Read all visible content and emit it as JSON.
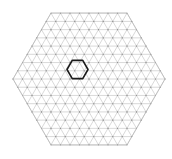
{
  "figure": {
    "title": "",
    "background_color": "#ffffff",
    "width": 172,
    "height": 159
  },
  "chart_data": {
    "type": "diagram",
    "subtype": "triangular-lattice-mesh",
    "title": "",
    "subtitle": "",
    "xlabel": "",
    "ylabel": "",
    "grid": true,
    "legend": null,
    "annotations": [],
    "domain": {
      "shape": "hexagon",
      "orientation": "flat-top",
      "center": [
        89,
        79
      ],
      "circumradius": 76,
      "vertices": [
        [
          13,
          79
        ],
        [
          51,
          13
        ],
        [
          127,
          13
        ],
        [
          165,
          79
        ],
        [
          127,
          145
        ],
        [
          51,
          145
        ]
      ],
      "edge_subdivisions": 8,
      "outline_color": "#b4b4b4",
      "outline_width": 0.7
    },
    "mesh": {
      "element_type": "triangle",
      "cells_per_side": 8,
      "edge_length_px": 9.5,
      "line_color": "#b9b9b9",
      "line_width": 0.55,
      "node_color": "#8c8c8c",
      "node_radius_px": 0.55,
      "node_count": 217,
      "triangle_count": 384
    },
    "highlight": {
      "label": "",
      "shape": "hexagon",
      "orientation": "flat-top",
      "center": [
        77.5,
        69.5
      ],
      "circumradius": 10.5,
      "stroke_color": "#1a1a1a",
      "stroke_width": 1.6,
      "fill": "none"
    }
  }
}
